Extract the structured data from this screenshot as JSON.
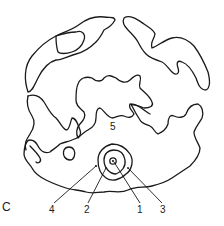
{
  "figure": {
    "panel_letter": "C",
    "labels": {
      "l1": "1",
      "l2": "2",
      "l3": "3",
      "l4": "4",
      "l5": "5"
    },
    "colors": {
      "stroke": "#1a1a1a",
      "background": "#ffffff"
    }
  }
}
